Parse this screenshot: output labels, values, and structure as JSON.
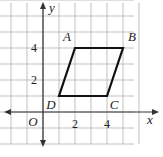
{
  "diagram": {
    "type": "coordinate-plane",
    "axis_labels": {
      "x": "x",
      "y": "y",
      "origin": "O"
    },
    "x_range": [
      -3,
      6
    ],
    "y_range": [
      -2,
      7
    ],
    "tick_labels": {
      "x": [
        {
          "value": 2,
          "label": "2"
        },
        {
          "value": 4,
          "label": "4"
        }
      ],
      "y": [
        {
          "value": 2,
          "label": "2"
        },
        {
          "value": 4,
          "label": "4"
        }
      ]
    },
    "polygon": {
      "name": "parallelogram ABCD",
      "vertices": [
        {
          "label": "A",
          "x": 2,
          "y": 4
        },
        {
          "label": "B",
          "x": 5,
          "y": 4
        },
        {
          "label": "C",
          "x": 4,
          "y": 1
        },
        {
          "label": "D",
          "x": 1,
          "y": 1
        }
      ]
    },
    "colors": {
      "grid": "#b0b0b0",
      "axes": "#333333",
      "polygon": "#111111"
    }
  }
}
